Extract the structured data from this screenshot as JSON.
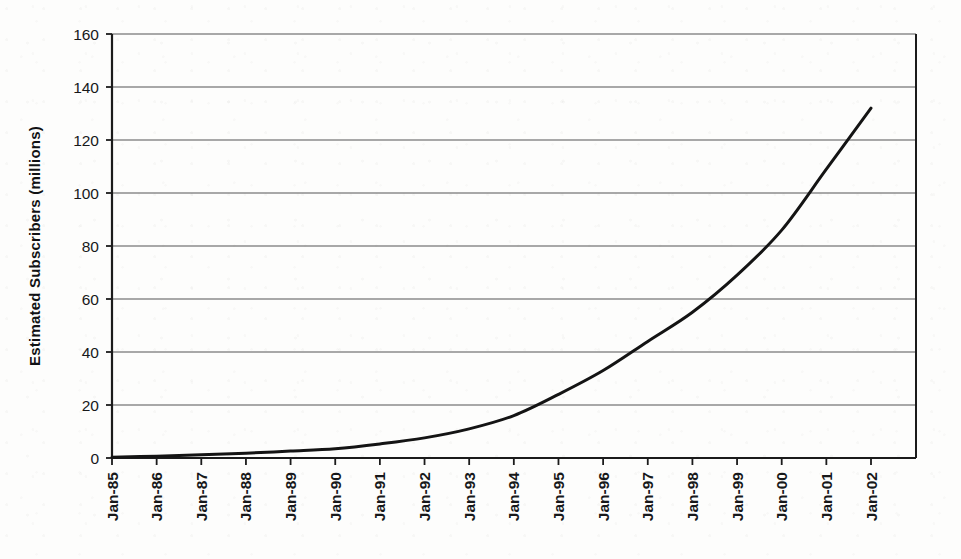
{
  "chart_data": {
    "type": "line",
    "title": "",
    "xlabel": "",
    "ylabel": "Estimated Subscribers (millions)",
    "ylim": [
      0,
      160
    ],
    "ytick_values": [
      0,
      20,
      40,
      60,
      80,
      100,
      120,
      140,
      160
    ],
    "ytick_labels": [
      "0",
      "20",
      "40",
      "60",
      "80",
      "100",
      "120",
      "140",
      "160"
    ],
    "grid": "horizontal",
    "legend": "none",
    "categories": [
      "Jan-85",
      "Jan-86",
      "Jan-87",
      "Jan-88",
      "Jan-89",
      "Jan-90",
      "Jan-91",
      "Jan-92",
      "Jan-93",
      "Jan-94",
      "Jan-95",
      "Jan-96",
      "Jan-97",
      "Jan-98",
      "Jan-99",
      "Jan-00",
      "Jan-01",
      "Jan-02"
    ],
    "xtick_rotation": -90,
    "series": [
      {
        "name": "Estimated Subscribers",
        "color": "#141414",
        "line_width": 3,
        "values": [
          0.3,
          0.7,
          1.2,
          1.8,
          2.6,
          3.5,
          5.3,
          7.6,
          11.0,
          16.0,
          24.0,
          33.0,
          44.0,
          55.0,
          69.0,
          86.0,
          109.0,
          132.0
        ]
      }
    ]
  }
}
